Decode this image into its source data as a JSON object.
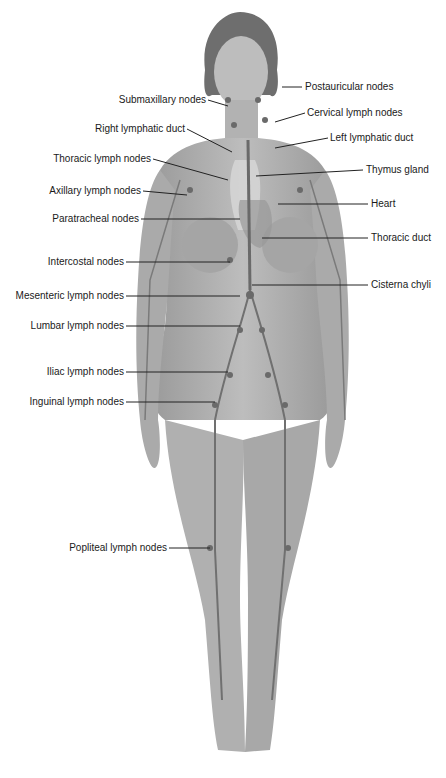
{
  "figure": {
    "labels_left": [
      {
        "text": "Submaxillary nodes",
        "x": 208,
        "y": 100
      },
      {
        "text": "Right lymphatic duct",
        "x": 187,
        "y": 129
      },
      {
        "text": "Thoracic lymph nodes",
        "x": 153,
        "y": 159
      },
      {
        "text": "Axillary lymph nodes",
        "x": 143,
        "y": 191
      },
      {
        "text": "Paratracheal nodes",
        "x": 141,
        "y": 219
      },
      {
        "text": "Intercostal nodes",
        "x": 126,
        "y": 262
      },
      {
        "text": "Mesenteric lymph nodes",
        "x": 126,
        "y": 296
      },
      {
        "text": "Lumbar lymph nodes",
        "x": 126,
        "y": 326
      },
      {
        "text": "Iliac lymph nodes",
        "x": 126,
        "y": 372
      },
      {
        "text": "Inguinal lymph nodes",
        "x": 126,
        "y": 402
      },
      {
        "text": "Popliteal lymph nodes",
        "x": 169,
        "y": 548
      }
    ],
    "labels_right": [
      {
        "text": "Postauricular nodes",
        "x": 305,
        "y": 87
      },
      {
        "text": "Cervical lymph nodes",
        "x": 307,
        "y": 113
      },
      {
        "text": "Left lymphatic duct",
        "x": 330,
        "y": 138
      },
      {
        "text": "Thymus gland",
        "x": 366,
        "y": 170
      },
      {
        "text": "Heart",
        "x": 371,
        "y": 204
      },
      {
        "text": "Thoracic duct",
        "x": 371,
        "y": 238
      },
      {
        "text": "Cisterna chyli",
        "x": 371,
        "y": 285
      }
    ]
  }
}
